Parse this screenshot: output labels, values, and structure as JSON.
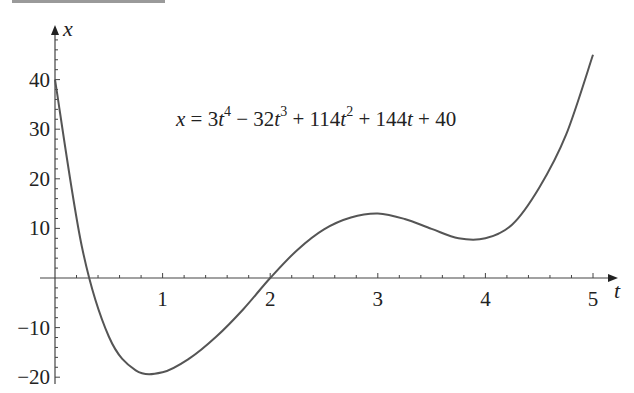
{
  "chart_data": {
    "type": "line",
    "title": "",
    "annotation": "x = 3t⁴ − 32t³ + 114t² + 144t + 40",
    "annotation_parts": [
      {
        "t": "x",
        "i": true
      },
      {
        "t": " = 3"
      },
      {
        "t": "t",
        "i": true
      },
      {
        "t": "4",
        "sup": true
      },
      {
        "t": " − 32"
      },
      {
        "t": "t",
        "i": true
      },
      {
        "t": "3",
        "sup": true
      },
      {
        "t": " + 114"
      },
      {
        "t": "t",
        "i": true
      },
      {
        "t": "2",
        "sup": true
      },
      {
        "t": " + 144"
      },
      {
        "t": "t",
        "i": true
      },
      {
        "t": " + 40"
      }
    ],
    "xlabel": "t",
    "ylabel": "x",
    "xlim": [
      0,
      5
    ],
    "ylim": [
      -20,
      45
    ],
    "x_ticks": [
      1,
      2,
      3,
      4,
      5
    ],
    "x_tick_labels": [
      "1",
      "2",
      "3",
      "4",
      "5"
    ],
    "y_ticks": [
      -20,
      -10,
      10,
      20,
      30,
      40
    ],
    "y_tick_labels": [
      "−20",
      "−10",
      "10",
      "20",
      "30",
      "40"
    ],
    "grid": false,
    "legend": null,
    "series": [
      {
        "name": "x(t)",
        "color": "#555555",
        "x": [
          0,
          0.25,
          0.5,
          0.75,
          1.0,
          1.25,
          1.5,
          1.75,
          2.0,
          2.25,
          2.5,
          2.75,
          3.0,
          3.25,
          3.5,
          3.75,
          4.0,
          4.25,
          4.5,
          4.75,
          5.0
        ],
        "values": [
          40,
          6.3,
          -11.8,
          -18.6,
          -19.0,
          -16.2,
          -11.8,
          -6.3,
          0,
          5.6,
          9.8,
          12.2,
          13.0,
          11.9,
          9.9,
          8.0,
          8.0,
          10.8,
          18.2,
          28.9,
          45.0
        ]
      }
    ]
  },
  "axes": {
    "x_axis_label": "t",
    "y_axis_label": "x"
  }
}
